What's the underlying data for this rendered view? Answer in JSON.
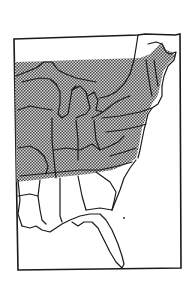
{
  "map": {
    "region": "Eastern United States",
    "shaded_range_description": "Stippled range covering the northern and central eastern states, from the Great Lakes and New England south to Tennessee, North Carolina and Virginia",
    "unshaded_states_visible": [
      "Louisiana",
      "Mississippi",
      "Alabama",
      "Georgia",
      "South Carolina",
      "Florida"
    ],
    "colors": {
      "background": "#ffffff",
      "outline": "#1a1a1a",
      "stipple_dark": "#4a4a4a",
      "stipple_light": "#d8d8d8"
    },
    "has_text_labels": false
  }
}
